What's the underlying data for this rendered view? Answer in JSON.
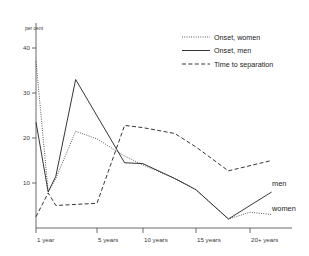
{
  "chart_data": {
    "type": "line",
    "title": "",
    "xlabel": "",
    "ylabel": "per cent",
    "ylim": [
      0,
      40
    ],
    "yticks": [
      10,
      20,
      30,
      40
    ],
    "ytick_labels": [
      "10",
      "20",
      "30",
      "40"
    ],
    "grid": false,
    "legend_position": "top-right",
    "x_axis": {
      "ticks": [
        1,
        5,
        10,
        15,
        20
      ],
      "tick_labels": [
        "1 year",
        "5 years",
        "10 years",
        "15 years",
        "20+ years"
      ]
    },
    "series": [
      {
        "name": "Onset, women",
        "style": "dotted",
        "end_label": "women",
        "x": [
          1,
          1.8,
          2.3,
          3.6,
          5,
          8,
          10,
          13,
          15,
          18,
          20,
          22
        ],
        "values": [
          37.0,
          8.0,
          11.0,
          21.5,
          19.8,
          16.0,
          14.0,
          11.0,
          8.5,
          2.0,
          3.5,
          3.0
        ]
      },
      {
        "name": "Onset, men",
        "style": "solid",
        "end_label": "men",
        "x": [
          1,
          1.8,
          2.3,
          3.6,
          8,
          10,
          13,
          15,
          18,
          22
        ],
        "values": [
          23.5,
          8.0,
          11.5,
          33.0,
          14.5,
          14.3,
          11.0,
          8.5,
          2.0,
          8.0
        ]
      },
      {
        "name": "Time to separation",
        "style": "dashed",
        "end_label": "",
        "x": [
          1,
          1.8,
          2.3,
          5,
          8,
          10,
          13,
          15,
          18,
          22
        ],
        "values": [
          2.5,
          7.8,
          5.0,
          5.5,
          22.8,
          22.3,
          21.0,
          18.0,
          12.7,
          15.0
        ]
      }
    ],
    "legend": [
      {
        "label": "Onset, women",
        "style": "dotted"
      },
      {
        "label": "Onset, men",
        "style": "solid"
      },
      {
        "label": "Time to separation",
        "style": "dashed"
      }
    ],
    "end_labels": [
      {
        "label": "men"
      },
      {
        "label": "women"
      }
    ]
  }
}
